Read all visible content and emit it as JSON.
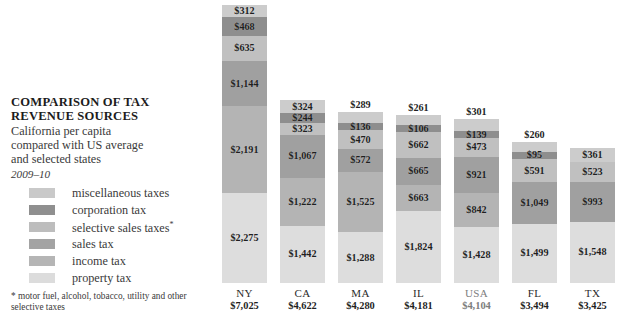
{
  "header": {
    "title_line1": "COMPARISON OF TAX",
    "title_line2": "REVENUE SOURCES",
    "subtitle_line1": "California per capita",
    "subtitle_line2": "compared with US average",
    "subtitle_line3": "and selected states",
    "period": "2009–10"
  },
  "legend": {
    "items": [
      {
        "label": "miscellaneous taxes",
        "color": "#c9c9c9"
      },
      {
        "label": "corporation tax",
        "color": "#8f8f8f"
      },
      {
        "label": "selective sales taxes*",
        "color": "#bdbdbd"
      },
      {
        "label": "sales tax",
        "color": "#a3a3a3"
      },
      {
        "label": "income tax",
        "color": "#b5b5b5"
      },
      {
        "label": "property tax",
        "color": "#dcdcdc"
      }
    ]
  },
  "footnote": "* motor fuel, alcohol, tobacco, utility and other selective taxes",
  "chart_data": {
    "type": "bar",
    "subtype": "stacked",
    "title": "COMPARISON OF TAX REVENUE SOURCES",
    "subtitle": "California per capita compared with US average and selected states",
    "period": "2009–10",
    "xlabel": "",
    "ylabel": "",
    "units": "US dollars per capita",
    "grid": false,
    "legend_position": "left",
    "categories": [
      "NY",
      "CA",
      "MA",
      "IL",
      "USA",
      "FL",
      "TX"
    ],
    "totals": [
      7025,
      4622,
      4280,
      4181,
      4104,
      3494,
      3425
    ],
    "total_labels": [
      "$7,025",
      "$4,622",
      "$4,280",
      "$4,181",
      "$4,104",
      "$3,494",
      "$3,425"
    ],
    "stack_order_top_to_bottom": [
      "miscellaneous taxes",
      "corporation tax",
      "selective sales taxes",
      "sales tax",
      "income tax",
      "property tax"
    ],
    "series": [
      {
        "name": "miscellaneous taxes",
        "color": "#c9c9c9",
        "values": [
          312,
          324,
          289,
          261,
          301,
          260,
          361
        ],
        "labels": [
          "$312",
          "$324",
          "$289",
          "$261",
          "$301",
          "$260",
          "$361"
        ]
      },
      {
        "name": "corporation tax",
        "color": "#8f8f8f",
        "values": [
          468,
          244,
          136,
          106,
          139,
          95,
          null
        ],
        "labels": [
          "$468",
          "$244",
          "$136",
          "$106",
          "$139",
          "$95",
          ""
        ]
      },
      {
        "name": "selective sales taxes",
        "color": "#bdbdbd",
        "values": [
          635,
          323,
          470,
          662,
          473,
          591,
          523
        ],
        "labels": [
          "$635",
          "$323",
          "$470",
          "$662",
          "$473",
          "$591",
          "$523"
        ]
      },
      {
        "name": "sales tax",
        "color": "#a3a3a3",
        "values": [
          1144,
          1067,
          572,
          665,
          921,
          1049,
          993
        ],
        "labels": [
          "$1,144",
          "$1,067",
          "$572",
          "$665",
          "$921",
          "$1,049",
          "$993"
        ]
      },
      {
        "name": "income tax",
        "color": "#b5b5b5",
        "values": [
          2191,
          1222,
          1525,
          663,
          842,
          null,
          null
        ],
        "labels": [
          "$2,191",
          "$1,222",
          "$1,525",
          "$663",
          "$842",
          "",
          ""
        ]
      },
      {
        "name": "property tax",
        "color": "#dcdcdc",
        "values": [
          2275,
          1442,
          1288,
          1824,
          1428,
          1499,
          1548
        ],
        "labels": [
          "$2,275",
          "$1,442",
          "$1,288",
          "$1,824",
          "$1,428",
          "$1,499",
          "$1,548"
        ]
      }
    ],
    "bars": [
      {
        "state": "NY",
        "total_label": "$7,025",
        "muted": false,
        "x": 222,
        "segments": [
          {
            "name": "miscellaneous taxes",
            "value": 312,
            "label": "$312",
            "color": "#cccccc"
          },
          {
            "name": "corporation tax",
            "value": 468,
            "label": "$468",
            "color": "#8e8e8e"
          },
          {
            "name": "selective sales taxes",
            "value": 635,
            "label": "$635",
            "color": "#c0c0c0"
          },
          {
            "name": "sales tax",
            "value": 1144,
            "label": "$1,144",
            "color": "#a0a0a0"
          },
          {
            "name": "income tax",
            "value": 2191,
            "label": "$2,191",
            "color": "#b4b4b4"
          },
          {
            "name": "property tax",
            "value": 2275,
            "label": "$2,275",
            "color": "#dddddd"
          }
        ]
      },
      {
        "state": "CA",
        "total_label": "$4,622",
        "muted": false,
        "x": 280,
        "segments": [
          {
            "name": "miscellaneous taxes",
            "value": 324,
            "label": "$324",
            "color": "#cccccc"
          },
          {
            "name": "corporation tax",
            "value": 244,
            "label": "$244",
            "color": "#8e8e8e"
          },
          {
            "name": "selective sales taxes",
            "value": 323,
            "label": "$323",
            "color": "#c0c0c0"
          },
          {
            "name": "sales tax",
            "value": 1067,
            "label": "$1,067",
            "color": "#a0a0a0"
          },
          {
            "name": "income tax",
            "value": 1222,
            "label": "$1,222",
            "color": "#b4b4b4"
          },
          {
            "name": "property tax",
            "value": 1442,
            "label": "$1,442",
            "color": "#dddddd"
          }
        ]
      },
      {
        "state": "MA",
        "total_label": "$4,280",
        "muted": false,
        "x": 338,
        "segments": [
          {
            "name": "miscellaneous taxes",
            "value": 289,
            "label": "$289",
            "color": "#cccccc",
            "label_above": true
          },
          {
            "name": "corporation tax",
            "value": 136,
            "label": "$136",
            "color": "#8e8e8e"
          },
          {
            "name": "selective sales taxes",
            "value": 470,
            "label": "$470",
            "color": "#c0c0c0"
          },
          {
            "name": "sales tax",
            "value": 572,
            "label": "$572",
            "color": "#a0a0a0"
          },
          {
            "name": "income tax",
            "value": 1525,
            "label": "$1,525",
            "color": "#b4b4b4"
          },
          {
            "name": "property tax",
            "value": 1288,
            "label": "$1,288",
            "color": "#dddddd"
          }
        ]
      },
      {
        "state": "IL",
        "total_label": "$4,181",
        "muted": false,
        "x": 396,
        "segments": [
          {
            "name": "miscellaneous taxes",
            "value": 261,
            "label": "$261",
            "color": "#cccccc",
            "label_above": true
          },
          {
            "name": "corporation tax",
            "value": 106,
            "label": "$106",
            "color": "#8e8e8e"
          },
          {
            "name": "selective sales taxes",
            "value": 662,
            "label": "$662",
            "color": "#c0c0c0"
          },
          {
            "name": "sales tax",
            "value": 665,
            "label": "$665",
            "color": "#a0a0a0"
          },
          {
            "name": "income tax",
            "value": 663,
            "label": "$663",
            "color": "#b4b4b4"
          },
          {
            "name": "property tax",
            "value": 1824,
            "label": "$1,824",
            "color": "#dddddd"
          }
        ]
      },
      {
        "state": "USA",
        "total_label": "$4,104",
        "muted": true,
        "x": 454,
        "segments": [
          {
            "name": "miscellaneous taxes",
            "value": 301,
            "label": "$301",
            "color": "#cccccc",
            "label_above": true
          },
          {
            "name": "corporation tax",
            "value": 139,
            "label": "$139",
            "color": "#8e8e8e"
          },
          {
            "name": "selective sales taxes",
            "value": 473,
            "label": "$473",
            "color": "#c0c0c0"
          },
          {
            "name": "sales tax",
            "value": 921,
            "label": "$921",
            "color": "#a0a0a0"
          },
          {
            "name": "income tax",
            "value": 842,
            "label": "$842",
            "color": "#b4b4b4"
          },
          {
            "name": "property tax",
            "value": 1428,
            "label": "$1,428",
            "color": "#dddddd"
          }
        ]
      },
      {
        "state": "FL",
        "total_label": "$3,494",
        "muted": false,
        "x": 512,
        "segments": [
          {
            "name": "miscellaneous taxes",
            "value": 260,
            "label": "$260",
            "color": "#cccccc",
            "label_above": true
          },
          {
            "name": "corporation tax",
            "value": 95,
            "label": "$95",
            "color": "#8e8e8e"
          },
          {
            "name": "selective sales taxes",
            "value": 591,
            "label": "$591",
            "color": "#c0c0c0"
          },
          {
            "name": "sales tax",
            "value": 1049,
            "label": "$1,049",
            "color": "#a0a0a0"
          },
          {
            "name": "property tax",
            "value": 1499,
            "label": "$1,499",
            "color": "#dddddd"
          }
        ]
      },
      {
        "state": "TX",
        "total_label": "$3,425",
        "muted": false,
        "x": 570,
        "segments": [
          {
            "name": "miscellaneous taxes",
            "value": 361,
            "label": "$361",
            "color": "#cccccc"
          },
          {
            "name": "selective sales taxes",
            "value": 523,
            "label": "$523",
            "color": "#c0c0c0"
          },
          {
            "name": "sales tax",
            "value": 993,
            "label": "$993",
            "color": "#a0a0a0"
          },
          {
            "name": "property tax",
            "value": 1548,
            "label": "$1,548",
            "color": "#dddddd"
          }
        ]
      }
    ]
  }
}
